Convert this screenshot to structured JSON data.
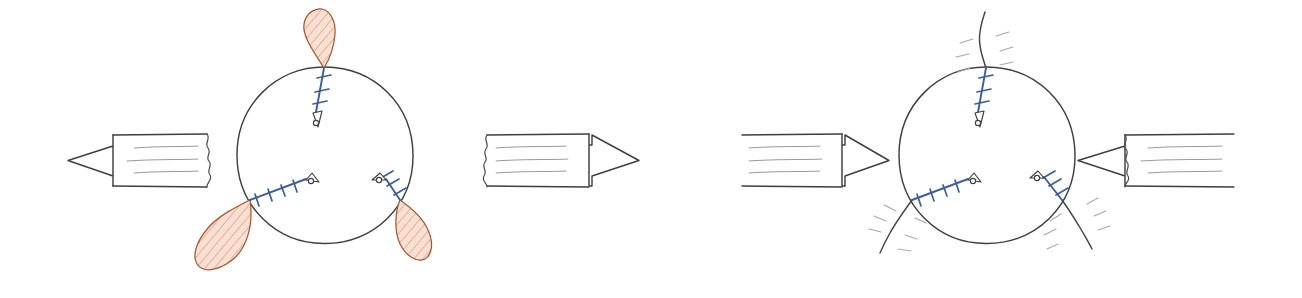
{
  "figure": {
    "background_color": "#ffffff",
    "ink_color": "#3f3f42",
    "screw_color": "#3a5f9e",
    "lobe_fill_color": "#f9ddd0",
    "lobe_stroke_color": "#a8572f",
    "speedline_color": "#9b9b9e"
  },
  "panels": [
    {
      "id": "panel-left",
      "name": "distraction-panel",
      "condition": "distraction",
      "arrow_direction": "outward",
      "marker_type": "lobe",
      "marker_count": 3,
      "circle": {
        "cx": 325,
        "cy": 155,
        "r": 88
      },
      "arrows": [
        {
          "name": "arrow-left-outward",
          "direction": "left",
          "tip_x": 68,
          "tail_x": 216,
          "cy": 160,
          "speed_lines": 3
        },
        {
          "name": "arrow-right-outward",
          "direction": "right",
          "tip_x": 592,
          "tail_x": 480,
          "cy": 160,
          "speed_lines": 3
        }
      ],
      "screws": [
        {
          "name": "screw-top",
          "angle_deg": 270,
          "entry_x": 325,
          "entry_y": 67,
          "length": 62,
          "threads": 3
        },
        {
          "name": "screw-lower-left",
          "angle_deg": 30,
          "entry_x": 249,
          "entry_y": 199,
          "length": 62,
          "threads": 4
        },
        {
          "name": "screw-lower-right",
          "angle_deg": 150,
          "entry_x": 401,
          "entry_y": 199,
          "length": 62,
          "threads": 4
        }
      ],
      "lobes": [
        {
          "name": "lobe-top",
          "anchor_x": 325,
          "anchor_y": 67,
          "angle_deg": 272,
          "length": 58,
          "width": 26
        },
        {
          "name": "lobe-lower-left",
          "anchor_x": 249,
          "anchor_y": 199,
          "angle_deg": 30,
          "length": 72,
          "width": 30
        },
        {
          "name": "lobe-lower-right",
          "anchor_x": 401,
          "anchor_y": 199,
          "angle_deg": 150,
          "length": 58,
          "width": 26
        }
      ]
    },
    {
      "id": "panel-right",
      "name": "compression-panel",
      "condition": "compression",
      "arrow_direction": "inward",
      "marker_type": "crack",
      "marker_count": 3,
      "circle": {
        "cx": 987,
        "cy": 155,
        "r": 88
      },
      "arrows": [
        {
          "name": "arrow-left-inward",
          "direction": "right",
          "tip_x": 880,
          "tail_x": 742,
          "cy": 160,
          "speed_lines": 3
        },
        {
          "name": "arrow-right-inward",
          "direction": "left",
          "tip_x": 1078,
          "tail_x": 1232,
          "cy": 160,
          "speed_lines": 3
        }
      ],
      "screws": [
        {
          "name": "screw-top",
          "angle_deg": 270,
          "entry_x": 987,
          "entry_y": 67,
          "length": 62,
          "threads": 3
        },
        {
          "name": "screw-lower-left",
          "angle_deg": 30,
          "entry_x": 911,
          "entry_y": 199,
          "length": 62,
          "threads": 4
        },
        {
          "name": "screw-lower-right",
          "angle_deg": 150,
          "entry_x": 1063,
          "entry_y": 199,
          "length": 62,
          "threads": 4
        }
      ],
      "cracks": [
        {
          "name": "crack-top",
          "anchor_x": 987,
          "anchor_y": 67,
          "angle_deg": 272,
          "length": 62,
          "sparks": 5
        },
        {
          "name": "crack-lower-left",
          "anchor_x": 911,
          "anchor_y": 199,
          "angle_deg": 30,
          "length": 58,
          "sparks": 5
        },
        {
          "name": "crack-lower-right",
          "anchor_x": 1063,
          "anchor_y": 199,
          "angle_deg": 150,
          "length": 58,
          "sparks": 5
        }
      ]
    }
  ]
}
